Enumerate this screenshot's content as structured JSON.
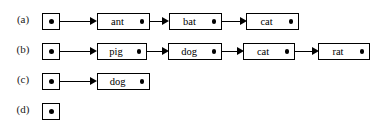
{
  "figure": {
    "type": "linked-list-diagram",
    "caption": "",
    "background_color": "#ffffff",
    "line_color": "#000000"
  },
  "rows": [
    {
      "label": "(a)",
      "head": {
        "name": "head-pointer",
        "dot": "•"
      },
      "nodes": [
        {
          "value": "ant",
          "pointer": "•"
        },
        {
          "value": "bat",
          "pointer": "•"
        },
        {
          "value": "cat",
          "pointer": "•"
        }
      ],
      "arrow_count": 3
    },
    {
      "label": "(b)",
      "head": {
        "name": "head-pointer",
        "dot": "•"
      },
      "nodes": [
        {
          "value": "pig",
          "pointer": "•"
        },
        {
          "value": "dog",
          "pointer": "•"
        },
        {
          "value": "cat",
          "pointer": "•"
        },
        {
          "value": "rat",
          "pointer": "•"
        }
      ],
      "arrow_count": 4
    },
    {
      "label": "(c)",
      "head": {
        "name": "head-pointer",
        "dot": "•"
      },
      "nodes": [
        {
          "value": "dog",
          "pointer": "•"
        }
      ],
      "arrow_count": 1
    },
    {
      "label": "(d)",
      "head": {
        "name": "head-pointer",
        "dot": "•"
      },
      "nodes": [],
      "arrow_count": 0
    }
  ]
}
